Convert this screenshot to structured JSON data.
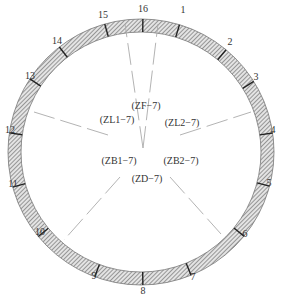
{
  "diagram": {
    "type": "tunnel-cross-section-monitoring-layout",
    "ring": {
      "center": [
        141,
        152
      ],
      "outer_radius": 133,
      "inner_radius": 120,
      "fill_pattern": "diagonal-hatch",
      "hatch_color": "#555555",
      "edge_color": "#666666"
    },
    "point_labels": [
      {
        "id": "1",
        "text": "1",
        "x": 183,
        "y": 13
      },
      {
        "id": "2",
        "text": "2",
        "x": 230,
        "y": 45
      },
      {
        "id": "3",
        "text": "3",
        "x": 256,
        "y": 80
      },
      {
        "id": "4",
        "text": "4",
        "x": 273,
        "y": 133
      },
      {
        "id": "5",
        "text": "5",
        "x": 269,
        "y": 186
      },
      {
        "id": "6",
        "text": "6",
        "x": 245,
        "y": 237
      },
      {
        "id": "7",
        "text": "7",
        "x": 193,
        "y": 280
      },
      {
        "id": "8",
        "text": "8",
        "x": 143,
        "y": 294
      },
      {
        "id": "9",
        "text": "9",
        "x": 94,
        "y": 279
      },
      {
        "id": "10",
        "text": "10",
        "x": 40,
        "y": 235
      },
      {
        "id": "11",
        "text": "11",
        "x": 13,
        "y": 187
      },
      {
        "id": "12",
        "text": "12",
        "x": 10,
        "y": 133
      },
      {
        "id": "13",
        "text": "13",
        "x": 30,
        "y": 79
      },
      {
        "id": "14",
        "text": "14",
        "x": 57,
        "y": 44
      },
      {
        "id": "15",
        "text": "15",
        "x": 103,
        "y": 18
      },
      {
        "id": "16",
        "text": "16",
        "x": 143,
        "y": 12
      }
    ],
    "zone_labels": [
      {
        "id": "ZF",
        "text": "(ZF−7)",
        "x": 146,
        "y": 109
      },
      {
        "id": "ZL1",
        "text": "(ZL1−7)",
        "x": 117,
        "y": 123
      },
      {
        "id": "ZL2",
        "text": "(ZL2−7)",
        "x": 182,
        "y": 126
      },
      {
        "id": "ZB1",
        "text": "(ZB1−7)",
        "x": 119,
        "y": 164
      },
      {
        "id": "ZB2",
        "text": "(ZB2−7)",
        "x": 181,
        "y": 164
      },
      {
        "id": "ZD",
        "text": "(ZD−7)",
        "x": 147,
        "y": 182
      }
    ],
    "rays": [
      {
        "id": "ray-ZF-left",
        "from": [
          143,
          148
        ],
        "to": [
          125,
          24
        ]
      },
      {
        "id": "ray-ZF-right",
        "from": [
          143,
          148
        ],
        "to": [
          158,
          24
        ]
      },
      {
        "id": "ray-ZL1",
        "from": [
          108,
          135
        ],
        "to": [
          34,
          112
        ]
      },
      {
        "id": "ray-ZL2",
        "from": [
          180,
          135
        ],
        "to": [
          251,
          112
        ]
      },
      {
        "id": "ray-ZB1",
        "from": [
          120,
          177
        ],
        "to": [
          64,
          240
        ]
      },
      {
        "id": "ray-ZB2",
        "from": [
          170,
          177
        ],
        "to": [
          221,
          234
        ]
      }
    ],
    "colors": {
      "ray": "#aaaaaa",
      "text": "#333333"
    }
  }
}
